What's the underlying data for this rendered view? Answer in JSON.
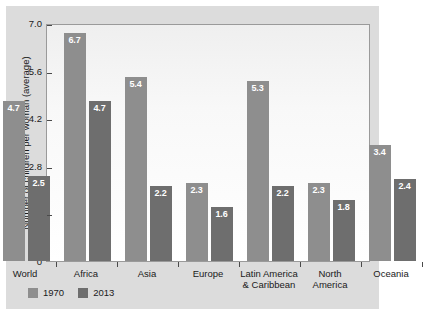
{
  "chart_data": {
    "type": "bar",
    "title": "",
    "xlabel": "",
    "ylabel": "Number of children per woman (average)",
    "ylim": [
      0,
      7.0
    ],
    "yticks": [
      "0",
      "1.4",
      "2.8",
      "4.2",
      "5.6",
      "7.0"
    ],
    "ytick_values": [
      0,
      1.4,
      2.8,
      4.2,
      5.6,
      7.0
    ],
    "grid": false,
    "legend_position": "bottom-left",
    "categories": [
      "World",
      "Africa",
      "Asia",
      "Europe",
      "Latin America\n& Caribbean",
      "North\nAmerica",
      "Oceania"
    ],
    "category_lines": [
      [
        "World"
      ],
      [
        "Africa"
      ],
      [
        "Asia"
      ],
      [
        "Europe"
      ],
      [
        "Latin America",
        "& Caribbean"
      ],
      [
        "North",
        "America"
      ],
      [
        "Oceania"
      ]
    ],
    "series": [
      {
        "name": "1970",
        "color": "#8e8e8e",
        "values": [
          4.7,
          6.7,
          5.4,
          2.3,
          5.3,
          2.3,
          3.4
        ],
        "labels": [
          "4.7",
          "6.7",
          "5.4",
          "2.3",
          "5.3",
          "2.3",
          "3.4"
        ]
      },
      {
        "name": "2013",
        "color": "#6e6e6e",
        "values": [
          2.5,
          4.7,
          2.2,
          1.6,
          2.2,
          1.8,
          2.4
        ],
        "labels": [
          "2.5",
          "4.7",
          "2.2",
          "1.6",
          "2.2",
          "1.8",
          "2.4"
        ]
      }
    ]
  },
  "legend": {
    "items": [
      {
        "label": "1970",
        "color": "#8e8e8e"
      },
      {
        "label": "2013",
        "color": "#6e6e6e"
      }
    ]
  },
  "colors": {
    "figure_background": "#dcdcdc",
    "plot_background": "#ffffff",
    "axis": "#4a4a4a",
    "text": "#1a1a1a",
    "series_1970": "#8e8e8e",
    "series_2013": "#6e6e6e",
    "value_label": "#ffffff"
  }
}
